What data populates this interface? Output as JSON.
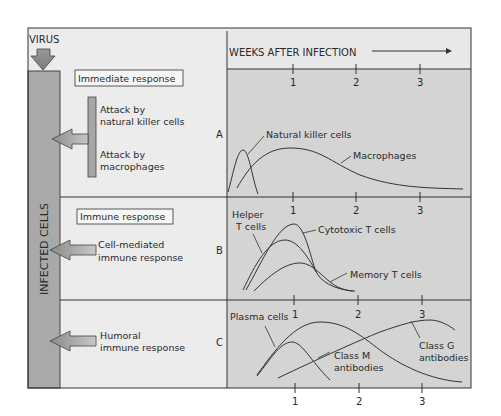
{
  "diagram": {
    "virus_label": "VIRUS",
    "infected_cells_label": "INFECTED CELLS",
    "header": {
      "axis_title": "WEEKS AFTER INFECTION",
      "ticks": [
        "1",
        "2",
        "3"
      ]
    },
    "sections": [
      {
        "id": "A",
        "box_label": "Immediate response",
        "items": [
          "Attack by natural killer cells",
          "Attack by macrophages"
        ],
        "item_lines": [
          [
            "Attack by",
            "natural killer cells"
          ],
          [
            "Attack by",
            "macrophages"
          ]
        ],
        "curves": [
          "Natural killer cells",
          "Macrophages"
        ]
      },
      {
        "id": "B",
        "box_label": "Immune response",
        "response_lines": [
          "Cell-mediated",
          "immune response"
        ],
        "curves": [
          "Helper T cells",
          "Cytotoxic T cells",
          "Memory T cells"
        ],
        "curve_label_lines": {
          "helper": [
            "Helper",
            "T cells"
          ]
        }
      },
      {
        "id": "C",
        "response_lines": [
          "Humoral",
          "immune response"
        ],
        "curves": [
          "Plasma cells",
          "Class M antibodies",
          "Class G antibodies"
        ],
        "curve_label_lines": {
          "classm": [
            "Class M",
            "antibodies"
          ],
          "classg": [
            "Class G",
            "antibodies"
          ]
        }
      }
    ],
    "colors": {
      "panel_gray": "#d2d2d2",
      "bar_gray": "#a8a8a8",
      "light_bg": "#ececec",
      "line": "#333333"
    }
  }
}
